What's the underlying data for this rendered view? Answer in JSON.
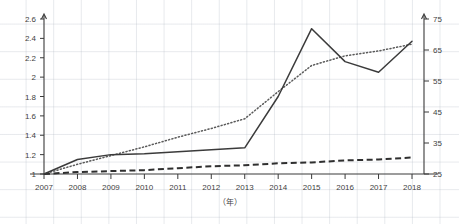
{
  "chart_data": {
    "type": "line",
    "title": "",
    "subtitle": "",
    "xlabel": "（年）",
    "ylabel": "",
    "ylabel_right": "",
    "grid": true,
    "legend": "none",
    "x": [
      2007,
      2008,
      2009,
      2010,
      2011,
      2012,
      2013,
      2014,
      2015,
      2016,
      2017,
      2018
    ],
    "xtick_labels": [
      "2007",
      "2008",
      "2009",
      "2010",
      "2011",
      "2012",
      "2013",
      "2014",
      "2015",
      "2016",
      "2017",
      "2018"
    ],
    "xlim": [
      2007,
      2018
    ],
    "ylim": [
      1.0,
      2.6
    ],
    "ytick_labels": [
      "1",
      "1.2",
      "1.4",
      "1.6",
      "1.8",
      "2",
      "2.2",
      "2.4",
      "2.6"
    ],
    "ytick_values": [
      1,
      1.2,
      1.4,
      1.6,
      1.8,
      2,
      2.2,
      2.4,
      2.6
    ],
    "ylim_right": [
      25,
      75
    ],
    "ytick_labels_right": [
      "25",
      "35",
      "45",
      "55",
      "65",
      "75"
    ],
    "ytick_values_right": [
      25,
      35,
      45,
      55,
      65,
      75
    ],
    "series": [
      {
        "name": "solid-series",
        "style": "solid",
        "axis": "left",
        "color": "#3b3b3b",
        "values": [
          1.0,
          1.15,
          1.2,
          1.21,
          1.23,
          1.25,
          1.27,
          1.8,
          2.5,
          2.16,
          2.05,
          2.37
        ]
      },
      {
        "name": "dotted-series",
        "style": "dotted",
        "axis": "left",
        "color": "#5a5a5a",
        "values": [
          1.0,
          1.1,
          1.19,
          1.28,
          1.38,
          1.47,
          1.57,
          1.85,
          2.12,
          2.22,
          2.27,
          2.34
        ]
      },
      {
        "name": "dashed-series",
        "style": "dashed",
        "axis": "left",
        "color": "#2f2f2f",
        "values": [
          1.0,
          1.02,
          1.03,
          1.04,
          1.06,
          1.08,
          1.09,
          1.11,
          1.12,
          1.14,
          1.15,
          1.17
        ]
      }
    ]
  }
}
